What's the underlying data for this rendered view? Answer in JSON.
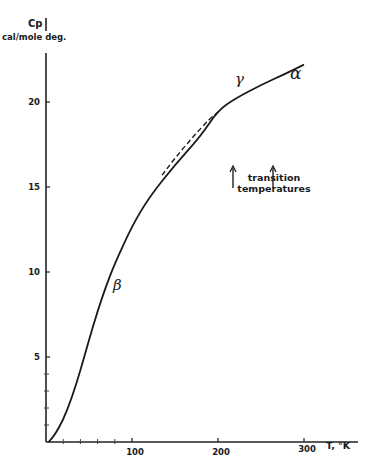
{
  "chart_data": {
    "type": "line",
    "title": "",
    "ylabel": "Cp",
    "ylabel_units": "cal/mole deg.",
    "xlabel": "T, °K",
    "xlim": [
      0,
      330
    ],
    "ylim": [
      0,
      23
    ],
    "x_ticks": [
      100,
      200,
      300
    ],
    "y_ticks": [
      5,
      10,
      15,
      20
    ],
    "grid": false,
    "series": [
      {
        "name": "Cp (solid)",
        "style": "solid",
        "x": [
          3,
          10,
          20,
          30,
          40,
          50,
          60,
          70,
          80,
          100,
          120,
          150,
          180,
          200,
          220,
          250,
          280,
          300
        ],
        "y": [
          0,
          0.4,
          1.3,
          2.6,
          4.2,
          6.0,
          7.7,
          9.2,
          10.5,
          12.7,
          14.4,
          16.3,
          18.0,
          19.5,
          20.2,
          21.0,
          21.7,
          22.2
        ]
      },
      {
        "name": "Cp (dashed extrapolation)",
        "style": "dashed",
        "x": [
          135,
          150,
          170,
          190,
          200
        ],
        "y": [
          15.7,
          16.7,
          17.9,
          19.0,
          19.4
        ]
      }
    ],
    "annotations": [
      {
        "text": "β",
        "x": 84,
        "y": 9.5
      },
      {
        "text": "γ",
        "x": 225,
        "y": 20.6
      },
      {
        "text": "α",
        "x": 290,
        "y": 21.2
      },
      {
        "text": "transition temperatures",
        "x": 240,
        "y": 15.3
      },
      {
        "text": "↑",
        "x": 218,
        "y": 17.8
      },
      {
        "text": "↑",
        "x": 264,
        "y": 17.8
      }
    ]
  },
  "labels": {
    "y_title": "Cp",
    "y_units": "cal/mole deg.",
    "x_title": "T, °K",
    "y_ticks": [
      "5",
      "10",
      "15",
      "20"
    ],
    "x_ticks": [
      "100",
      "200",
      "300"
    ],
    "beta": "β",
    "gamma": "γ",
    "alpha": "α",
    "transition_line1": "transition",
    "transition_line2": "temperatures"
  }
}
